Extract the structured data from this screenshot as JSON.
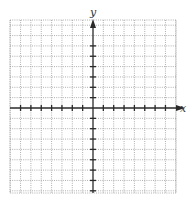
{
  "chart_data": {
    "type": "scatter",
    "title": "",
    "xlabel": "x",
    "ylabel": "y",
    "xlim": [
      -8,
      8
    ],
    "ylim": [
      -8,
      9
    ],
    "grid": true,
    "grid_style": "dotted",
    "x_ticks": [
      -7,
      -6,
      -5,
      -4,
      -3,
      -2,
      -1,
      1,
      2,
      3,
      4,
      5,
      6,
      7
    ],
    "y_ticks": [
      -8,
      -7,
      -6,
      -5,
      -4,
      -3,
      -2,
      -1,
      1,
      2,
      3,
      4,
      5,
      6
    ],
    "tick_labels_shown": false,
    "series": [],
    "colors": {
      "grid": "#9a9a9a",
      "axis": "#2a2a2a",
      "label": "#333333"
    }
  }
}
